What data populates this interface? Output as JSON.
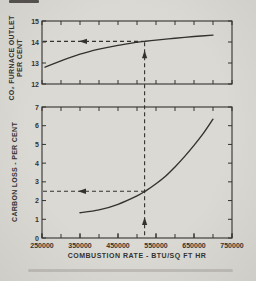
{
  "figure": {
    "background": "#dbd9d4",
    "ink": "#34322f"
  },
  "chart_data": [
    {
      "type": "line",
      "id": "co2-furnace-outlet-panel",
      "panel": "top",
      "ylabel_lines": [
        "CO₂ FURNACE OUTLET",
        "PER CENT"
      ],
      "xlim": [
        250000,
        750000
      ],
      "ylim": [
        12,
        15
      ],
      "yticks": [
        12,
        13,
        14,
        15
      ],
      "x_minor_tick_step": 50000,
      "grid": false,
      "series": [
        {
          "name": "co2-vs-combustion-rate",
          "x": [
            258000,
            300000,
            350000,
            400000,
            450000,
            500000,
            520000,
            550000,
            600000,
            650000,
            700000
          ],
          "y": [
            12.8,
            13.1,
            13.42,
            13.66,
            13.84,
            13.99,
            14.03,
            14.09,
            14.18,
            14.26,
            14.33
          ]
        }
      ],
      "annotation": {
        "x": 520000,
        "y": 14.03,
        "style": "dashed crosshair, left arrow to y-axis, up arrow from x-axis"
      }
    },
    {
      "type": "line",
      "id": "carbon-loss-panel",
      "panel": "bottom",
      "ylabel": "CARBON LOSS - PER CENT",
      "xlabel": "COMBUSTION RATE - BTU/SQ FT HR",
      "xlim": [
        250000,
        750000
      ],
      "ylim": [
        0,
        7
      ],
      "yticks": [
        0,
        1,
        2,
        3,
        4,
        5,
        6,
        7
      ],
      "x_minor_tick_step": 50000,
      "grid": false,
      "xtick_labels": [
        {
          "value": 250000,
          "label": "250000"
        },
        {
          "value": 350000,
          "label": "350000"
        },
        {
          "value": 450000,
          "label": "450000"
        },
        {
          "value": 550000,
          "label": "550000"
        },
        {
          "value": 650000,
          "label": "650000"
        },
        {
          "value": 750000,
          "label": "750000"
        }
      ],
      "series": [
        {
          "name": "carbon-loss-vs-combustion-rate",
          "x": [
            350000,
            400000,
            450000,
            500000,
            525000,
            550000,
            575000,
            600000,
            625000,
            650000,
            675000,
            700000
          ],
          "y": [
            1.35,
            1.5,
            1.8,
            2.25,
            2.55,
            2.9,
            3.3,
            3.8,
            4.35,
            4.95,
            5.6,
            6.35
          ]
        }
      ],
      "annotation": {
        "x": 520000,
        "y": 2.5,
        "style": "dashed crosshair, left arrow to y-axis, up arrow from x-axis"
      }
    }
  ]
}
